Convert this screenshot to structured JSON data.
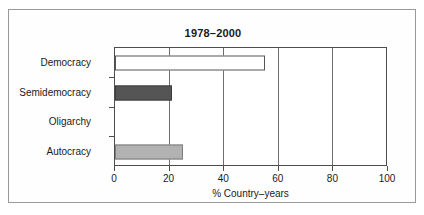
{
  "figure": {
    "title": "1978–2000"
  },
  "chart_data": {
    "type": "bar",
    "orientation": "horizontal",
    "title": "1978–2000",
    "xlabel": "% Country–years",
    "ylabel": "",
    "categories": [
      "Democracy",
      "Semidemocracy",
      "Oligarchy",
      "Autocracy"
    ],
    "values": [
      55,
      21,
      0,
      25
    ],
    "series": [
      {
        "name": "% Country-years",
        "values": [
          55,
          21,
          0,
          25
        ]
      }
    ],
    "bar_styles": [
      {
        "category": "Democracy",
        "fill": "#ffffff",
        "edge": "#555555",
        "style": "open"
      },
      {
        "category": "Semidemocracy",
        "fill": "#555555",
        "edge": "#3c3c3c",
        "style": "dark"
      },
      {
        "category": "Oligarchy",
        "fill": "none",
        "edge": "none",
        "style": "empty"
      },
      {
        "category": "Autocracy",
        "fill": "#b2b2b2",
        "edge": "#7d7d7d",
        "style": "light"
      }
    ],
    "xlim": [
      0,
      100
    ],
    "xticks": [
      0,
      20,
      40,
      60,
      80,
      100
    ],
    "xtick_labels": [
      "0",
      "20",
      "40",
      "60",
      "80",
      "100"
    ],
    "grid": "vertical",
    "legend": "none",
    "axis_color": "#4d4d4d",
    "text_color": "#1a1a1a"
  }
}
